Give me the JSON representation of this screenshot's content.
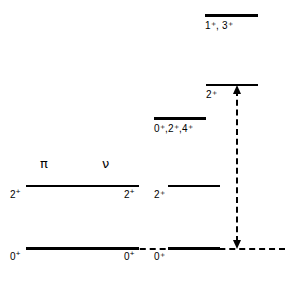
{
  "figure": {
    "type": "nuclear-energy-level-diagram",
    "background_color": "#ffffff",
    "line_color": "#000000",
    "width": 304,
    "height": 281
  },
  "column_headers": {
    "proton_symbol": "π",
    "neutron_symbol": "ν"
  },
  "single_particle": {
    "proton": {
      "ground_label": "0",
      "ground_superscript": "+",
      "excited_label": "2",
      "excited_superscript": "+"
    },
    "neutron": {
      "ground_label": "0",
      "ground_superscript": "+",
      "excited_label": "2",
      "excited_superscript": "+"
    }
  },
  "coupled_levels": [
    {
      "name": "ground-state",
      "label": "0",
      "superscript": "+",
      "label_text": "0⁺"
    },
    {
      "name": "first-excited",
      "label": "2",
      "superscript": "+",
      "label_text": "2⁺"
    },
    {
      "name": "multiplet-024",
      "label": "0⁺,2⁺,4⁺",
      "label_text": "0⁺,2⁺,4⁺"
    },
    {
      "name": "transition-target",
      "label": "2",
      "superscript": "+",
      "label_text": "2⁺"
    },
    {
      "name": "multiplet-13",
      "label": "1⁺, 3⁺",
      "label_text": "1⁺, 3⁺"
    }
  ],
  "transition_arrow": {
    "name": "excitation-transition",
    "style": "dashed",
    "double_headed": true
  }
}
